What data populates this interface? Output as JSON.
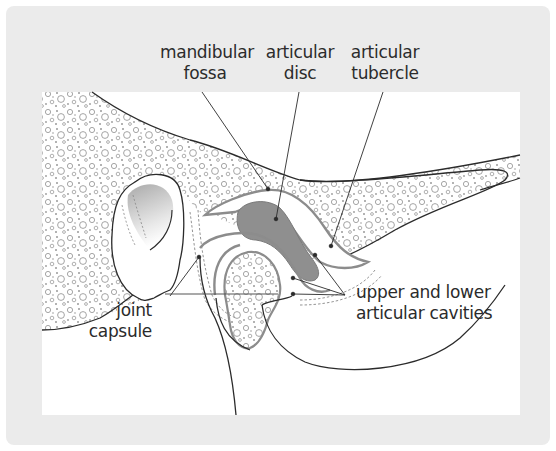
{
  "figure": {
    "colors": {
      "background_frame": "#ebebeb",
      "panel": "#ffffff",
      "outline": "#2b2b2b",
      "disc_fill": "#8f8f8f",
      "disc_stroke": "#7a7a7a",
      "cavity_stroke": "#8c8c8c",
      "bone_dots": "#9a9a9a",
      "condyle_shade": "#b5b5b5"
    },
    "labels": {
      "mandibular_fossa": {
        "line1": "mandibular",
        "line2": "fossa"
      },
      "articular_disc": {
        "line1": "articular",
        "line2": "disc"
      },
      "articular_tubercle": {
        "line1": "articular",
        "line2": "tubercle"
      },
      "joint_capsule": {
        "line1": "joint",
        "line2": "capsule"
      },
      "cavities": {
        "line1": "upper and lower",
        "line2": "articular cavities"
      }
    }
  }
}
